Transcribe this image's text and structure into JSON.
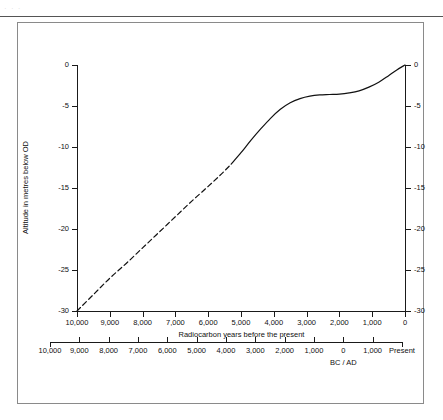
{
  "page": {
    "header_ghost": "· · ·"
  },
  "chart_data": {
    "type": "line",
    "title": "",
    "xlabel": "Radiocarbon years before the present",
    "ylabel": "Altitude in metres below OD",
    "secondary_xlabel": "BC / AD",
    "xlim": [
      10000,
      0
    ],
    "ylim": [
      -30,
      0
    ],
    "grid": false,
    "legend": null,
    "x_ticks": [
      {
        "value": 10000,
        "label": "10,000"
      },
      {
        "value": 9000,
        "label": "9,000"
      },
      {
        "value": 8000,
        "label": "8,000"
      },
      {
        "value": 7000,
        "label": "7,000"
      },
      {
        "value": 6000,
        "label": "6,000"
      },
      {
        "value": 5000,
        "label": "5,000"
      },
      {
        "value": 4000,
        "label": "4,000"
      },
      {
        "value": 3000,
        "label": "3,000"
      },
      {
        "value": 2000,
        "label": "2,000"
      },
      {
        "value": 1000,
        "label": "1,000"
      },
      {
        "value": 0,
        "label": "0"
      }
    ],
    "y_ticks": [
      {
        "value": 0,
        "label": "0"
      },
      {
        "value": -5,
        "label": "-5"
      },
      {
        "value": -10,
        "label": "-10"
      },
      {
        "value": -15,
        "label": "-15"
      },
      {
        "value": -20,
        "label": "-20"
      },
      {
        "value": -25,
        "label": "-25"
      },
      {
        "value": -30,
        "label": "-30"
      }
    ],
    "y_ticks_right": [
      {
        "value": 0,
        "label": "0"
      },
      {
        "value": -5,
        "label": "-5"
      },
      {
        "value": -10,
        "label": "-10"
      },
      {
        "value": -15,
        "label": "-15"
      },
      {
        "value": -20,
        "label": "-20"
      },
      {
        "value": -25,
        "label": "-25"
      },
      {
        "value": -30,
        "label": "-30"
      }
    ],
    "secondary_x_ticks": [
      {
        "pos": 10000,
        "label": "10,000"
      },
      {
        "pos": 9000,
        "label": "9,000"
      },
      {
        "pos": 8000,
        "label": "8,000"
      },
      {
        "pos": 7000,
        "label": "7,000"
      },
      {
        "pos": 6000,
        "label": "6,000"
      },
      {
        "pos": 5000,
        "label": "5,000"
      },
      {
        "pos": 4000,
        "label": "4,000"
      },
      {
        "pos": 3000,
        "label": "3,000"
      },
      {
        "pos": 2000,
        "label": "2,000"
      },
      {
        "pos": 1000,
        "label": "1,000"
      },
      {
        "pos": 0,
        "label": "0"
      },
      {
        "pos": -1000,
        "label": "1,000"
      },
      {
        "pos": -2000,
        "label": "Present"
      }
    ],
    "secondary_title_pos": 0,
    "series": [
      {
        "name": "sea-level curve (extrapolated)",
        "style": "dashed",
        "color": "#111111",
        "points": [
          [
            10000,
            -30.0
          ],
          [
            9500,
            -28.0
          ],
          [
            9000,
            -26.0
          ],
          [
            8500,
            -24.2
          ],
          [
            8000,
            -22.3
          ],
          [
            7500,
            -20.4
          ],
          [
            7000,
            -18.5
          ],
          [
            6500,
            -16.6
          ],
          [
            6000,
            -14.8
          ],
          [
            5600,
            -13.3
          ],
          [
            5300,
            -12.1
          ]
        ]
      },
      {
        "name": "sea-level curve (measured)",
        "style": "solid",
        "color": "#111111",
        "points": [
          [
            5300,
            -12.1
          ],
          [
            5000,
            -10.7
          ],
          [
            4700,
            -9.2
          ],
          [
            4400,
            -7.8
          ],
          [
            4100,
            -6.5
          ],
          [
            3800,
            -5.4
          ],
          [
            3500,
            -4.6
          ],
          [
            3200,
            -4.1
          ],
          [
            2900,
            -3.8
          ],
          [
            2600,
            -3.65
          ],
          [
            2300,
            -3.6
          ],
          [
            2000,
            -3.55
          ],
          [
            1700,
            -3.4
          ],
          [
            1400,
            -3.15
          ],
          [
            1100,
            -2.7
          ],
          [
            800,
            -2.1
          ],
          [
            500,
            -1.3
          ],
          [
            250,
            -0.6
          ],
          [
            0,
            0.0
          ]
        ]
      }
    ]
  }
}
